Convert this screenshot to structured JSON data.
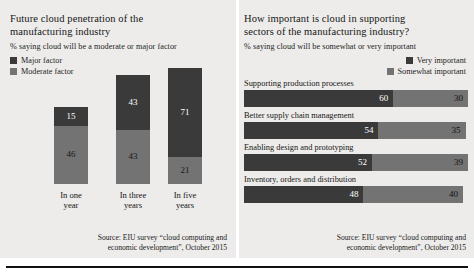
{
  "left_panel": {
    "title_line1": "Future cloud penetration of the",
    "title_line2": "manufacturing industry",
    "subtitle": "% saying cloud will be a moderate or major factor",
    "legend": [
      {
        "label": "Major factor",
        "color": "#3a3a3a",
        "icon": "legend-swatch-icon"
      },
      {
        "label": "Moderate factor",
        "color": "#737373",
        "icon": "legend-swatch-icon"
      }
    ],
    "source_line1": "Source: EIU survey “cloud computing and",
    "source_line2": "economic development”, October 2015"
  },
  "right_panel": {
    "title_line1": "How important is cloud in supporting",
    "title_line2": "sectors of the manufacturing industry?",
    "subtitle": "% saying cloud will be somewhat or very important",
    "legend": [
      {
        "label": "Very important",
        "color": "#3a3a3a",
        "icon": "legend-swatch-icon"
      },
      {
        "label": "Somewhat important",
        "color": "#737373",
        "icon": "legend-swatch-icon"
      }
    ],
    "source_line1": "Source: EIU survey “cloud computing and",
    "source_line2": "economic development”, October 2015"
  },
  "colors": {
    "dark": "#3a3a3a",
    "light": "#737373",
    "panel_background": "#edecea",
    "page_background": "#ffffff",
    "rule": "#111111"
  },
  "chart_data": [
    {
      "type": "bar",
      "orientation": "vertical",
      "stacked": true,
      "title": "Future cloud penetration of the manufacturing industry",
      "subtitle": "% saying cloud will be a moderate or major factor",
      "xlabel": "",
      "ylabel": "",
      "ylim": [
        0,
        95
      ],
      "grid": false,
      "legend_position": "top-left",
      "categories": [
        "In one year",
        "In three years",
        "In five years"
      ],
      "category_lines": [
        [
          "In one",
          "year"
        ],
        [
          "In three",
          "years"
        ],
        [
          "In five",
          "years"
        ]
      ],
      "series": [
        {
          "name": "Major factor",
          "color": "#3a3a3a",
          "values": [
            15,
            43,
            71
          ]
        },
        {
          "name": "Moderate factor",
          "color": "#737373",
          "values": [
            46,
            43,
            21
          ]
        }
      ],
      "totals": [
        61,
        86,
        92
      ],
      "source": "Source: EIU survey “cloud computing and economic development”, October 2015"
    },
    {
      "type": "bar",
      "orientation": "horizontal",
      "stacked": true,
      "title": "How important is cloud in supporting sectors of the manufacturing industry?",
      "subtitle": "% saying cloud will be somewhat or very important",
      "xlabel": "",
      "ylabel": "",
      "xlim": [
        0,
        90
      ],
      "grid": false,
      "legend_position": "top-right",
      "categories": [
        "Supporting production processes",
        "Better supply chain management",
        "Enabling design and prototyping",
        "Inventory, orders and distribution"
      ],
      "series": [
        {
          "name": "Very important",
          "color": "#3a3a3a",
          "values": [
            60,
            54,
            52,
            48
          ]
        },
        {
          "name": "Somewhat important",
          "color": "#737373",
          "values": [
            30,
            35,
            39,
            40
          ]
        }
      ],
      "totals": [
        90,
        89,
        91,
        88
      ],
      "source": "Source: EIU survey “cloud computing and economic development”, October 2015"
    }
  ]
}
